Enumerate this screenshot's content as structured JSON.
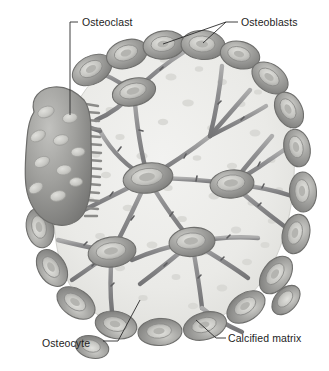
{
  "figure": {
    "background_color": "#ffffff"
  },
  "labels": {
    "osteoclast": "Osteoclast",
    "osteoblasts": "Osteoblasts",
    "osteocyte": "Osteocyte",
    "calcified_matrix": "Calcified matrix"
  },
  "palette": {
    "matrix_fill": "#e9e9e6",
    "matrix_edge": "#d3d3cf",
    "matrix_speckle": "#d8d8d4",
    "cell_body": "#9c9c99",
    "cell_mid": "#b0b0ad",
    "cell_light": "#c9c9c5",
    "cell_nucleus": "#d9d9d5",
    "cell_outline": "#6f6f6d",
    "process": "#98989a",
    "process_dark": "#6a6a6c",
    "osteoclast_body": "#9a9a98",
    "osteoclast_nucleus": "#cdcdc9",
    "ruffled_border": "#8f8f8d",
    "leader_line": "#2a2a2a",
    "label_text": "#1d1d1d"
  },
  "structures": {
    "osteoclast": {
      "name": "Osteoclast",
      "description": "Large multinucleated bone-resorbing cell at left margin",
      "nuclei_count": 10,
      "ruffled_border_folds": 26,
      "center": [
        57,
        155
      ]
    },
    "osteoblasts": {
      "name": "Osteoblasts",
      "description": "Bone-forming cells ringing the perimeter of the calcified matrix",
      "count": 21
    },
    "osteocytes": {
      "name": "Osteocyte",
      "description": "Mature bone cells embedded in lacunae within the matrix, joined by canaliculi",
      "count": 5
    },
    "calcified_matrix": {
      "name": "Calcified matrix",
      "description": "Mineralized bone matrix filling the interior of the bone mass"
    },
    "canaliculi": {
      "name": "Canaliculi",
      "description": "Slender cytoplasmic processes connecting osteocytes to each other and to surface osteoblasts"
    }
  }
}
